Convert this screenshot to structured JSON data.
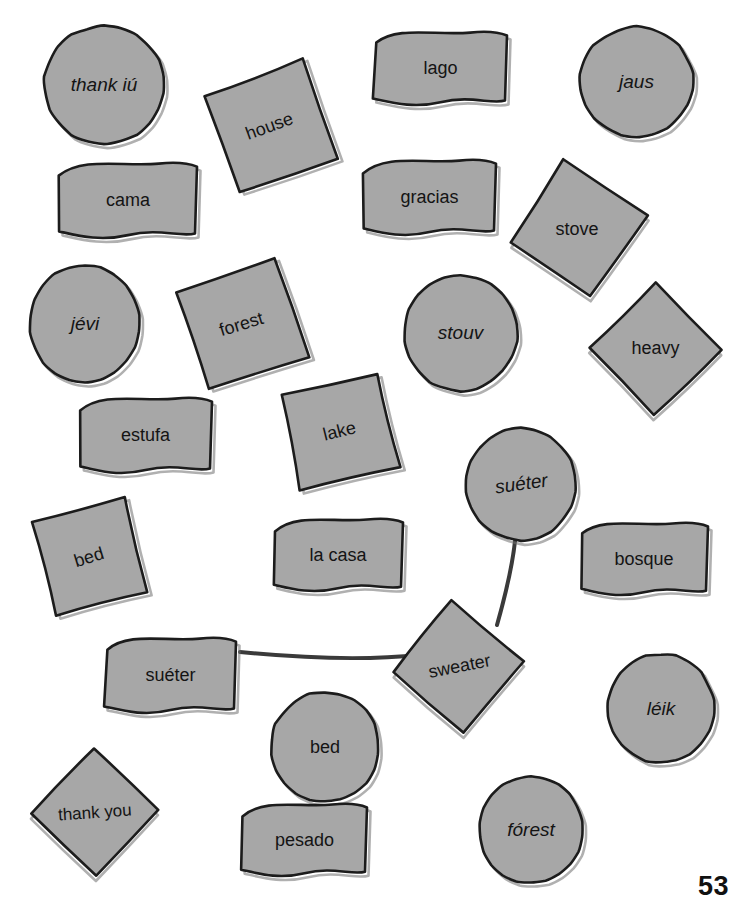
{
  "worksheet": {
    "page_number": "53",
    "fill_color": "#a7a7a7",
    "outline_color": "#1c1c1c",
    "shadow_color": "#6f6f6f",
    "text_color": "#141414",
    "background_color": "#ffffff"
  },
  "cards": [
    {
      "id": "c1",
      "text": "thank iú",
      "shape": "circle",
      "style": "italic",
      "x": 44,
      "y": 26,
      "w": 120,
      "h": 118,
      "rot": 0,
      "textrot": 0,
      "fontsize": 19
    },
    {
      "id": "c2",
      "text": "house",
      "shape": "square",
      "style": "normal",
      "x": 217,
      "y": 74,
      "w": 105,
      "h": 105,
      "rot": -20,
      "textrot": -20,
      "fontsize": 18
    },
    {
      "id": "c3",
      "text": "lago",
      "shape": "banner",
      "style": "normal",
      "x": 373,
      "y": 32,
      "w": 135,
      "h": 73,
      "rot": 0,
      "textrot": 0,
      "fontsize": 18
    },
    {
      "id": "c4",
      "text": "jaus",
      "shape": "circle",
      "style": "italic",
      "x": 580,
      "y": 27,
      "w": 113,
      "h": 110,
      "rot": 0,
      "textrot": 0,
      "fontsize": 19
    },
    {
      "id": "c5",
      "text": "cama",
      "shape": "banner",
      "style": "normal",
      "x": 58,
      "y": 163,
      "w": 140,
      "h": 75,
      "rot": 0,
      "textrot": 0,
      "fontsize": 18
    },
    {
      "id": "c6",
      "text": "gracias",
      "shape": "banner",
      "style": "normal",
      "x": 362,
      "y": 160,
      "w": 135,
      "h": 75,
      "rot": 0,
      "textrot": 0,
      "fontsize": 18
    },
    {
      "id": "c7",
      "text": "stove",
      "shape": "square",
      "style": "normal",
      "x": 528,
      "y": 180,
      "w": 98,
      "h": 98,
      "rot": 34,
      "textrot": 0,
      "fontsize": 18
    },
    {
      "id": "c8",
      "text": "jévi",
      "shape": "circle",
      "style": "italic",
      "x": 30,
      "y": 265,
      "w": 110,
      "h": 117,
      "rot": 0,
      "textrot": 0,
      "fontsize": 19
    },
    {
      "id": "c9",
      "text": "forest",
      "shape": "square",
      "style": "normal",
      "x": 190,
      "y": 272,
      "w": 104,
      "h": 104,
      "rot": -18,
      "textrot": -17,
      "fontsize": 18
    },
    {
      "id": "c10",
      "text": "stouv",
      "shape": "circle",
      "style": "italic",
      "x": 404,
      "y": 275,
      "w": 113,
      "h": 116,
      "rot": 0,
      "textrot": 0,
      "fontsize": 19
    },
    {
      "id": "c11",
      "text": "heavy",
      "shape": "square",
      "style": "normal",
      "x": 609,
      "y": 302,
      "w": 93,
      "h": 93,
      "rot": 45,
      "textrot": 0,
      "fontsize": 18
    },
    {
      "id": "c12",
      "text": "estufa",
      "shape": "banner",
      "style": "normal",
      "x": 78,
      "y": 398,
      "w": 135,
      "h": 75,
      "rot": 0,
      "textrot": 0,
      "fontsize": 18
    },
    {
      "id": "c13",
      "text": "lake",
      "shape": "square",
      "style": "normal",
      "x": 290,
      "y": 381,
      "w": 100,
      "h": 100,
      "rot": -12,
      "textrot": -14,
      "fontsize": 18
    },
    {
      "id": "c14",
      "text": "suéter",
      "shape": "circle",
      "style": "italic",
      "x": 466,
      "y": 428,
      "w": 110,
      "h": 112,
      "rot": 0,
      "textrot": -8,
      "fontsize": 19
    },
    {
      "id": "c15",
      "text": "bed",
      "shape": "square",
      "style": "normal",
      "x": 41,
      "y": 509,
      "w": 97,
      "h": 97,
      "rot": -14,
      "textrot": -17,
      "fontsize": 18
    },
    {
      "id": "c16",
      "text": "la casa",
      "shape": "banner",
      "style": "normal",
      "x": 272,
      "y": 519,
      "w": 132,
      "h": 72,
      "rot": 0,
      "textrot": 0,
      "fontsize": 18
    },
    {
      "id": "c17",
      "text": "bosque",
      "shape": "banner",
      "style": "normal",
      "x": 579,
      "y": 523,
      "w": 130,
      "h": 72,
      "rot": 0,
      "textrot": 0,
      "fontsize": 18
    },
    {
      "id": "c18",
      "text": "suéter",
      "shape": "banner",
      "style": "normal",
      "x": 104,
      "y": 638,
      "w": 133,
      "h": 75,
      "rot": 0,
      "textrot": 0,
      "fontsize": 18
    },
    {
      "id": "c19",
      "text": "sweater",
      "shape": "square",
      "style": "normal",
      "x": 413,
      "y": 620,
      "w": 93,
      "h": 93,
      "rot": 40,
      "textrot": -11,
      "fontsize": 18
    },
    {
      "id": "c20",
      "text": "léik",
      "shape": "circle",
      "style": "italic",
      "x": 608,
      "y": 654,
      "w": 106,
      "h": 109,
      "rot": 0,
      "textrot": 0,
      "fontsize": 19
    },
    {
      "id": "c21",
      "text": "bed",
      "shape": "circle",
      "style": "normal",
      "x": 271,
      "y": 692,
      "w": 108,
      "h": 110,
      "rot": 0,
      "textrot": 0,
      "fontsize": 18
    },
    {
      "id": "c22",
      "text": "thank you",
      "shape": "square",
      "style": "normal",
      "x": 50,
      "y": 768,
      "w": 90,
      "h": 90,
      "rot": 45,
      "textrot": -4,
      "fontsize": 17
    },
    {
      "id": "c23",
      "text": "pesado",
      "shape": "banner",
      "style": "normal",
      "x": 241,
      "y": 804,
      "w": 127,
      "h": 72,
      "rot": 0,
      "textrot": 0,
      "fontsize": 18
    },
    {
      "id": "c24",
      "text": "fórest",
      "shape": "circle",
      "style": "italic",
      "x": 479,
      "y": 776,
      "w": 104,
      "h": 107,
      "rot": 0,
      "textrot": 0,
      "fontsize": 19
    }
  ],
  "connections": [
    {
      "id": "l1",
      "from": "suéter-circle",
      "to": "sweater-square",
      "path": "M 515,541 C 512,570 504,600 497,625"
    },
    {
      "id": "l2",
      "from": "suéter-banner",
      "to": "sweater-square",
      "path": "M 240,652 C 300,658 360,661 420,655"
    }
  ]
}
